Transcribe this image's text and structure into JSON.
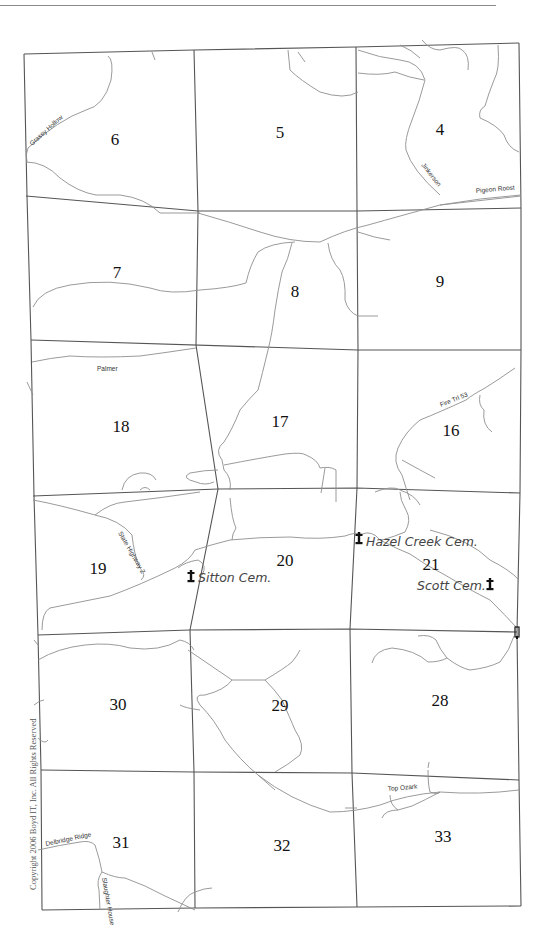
{
  "map": {
    "copyright": "Copyright 2006 Boyd IT, Inc. All Rights Reserved",
    "sections": [
      {
        "id": "6",
        "label": "6",
        "x": 115,
        "y": 145
      },
      {
        "id": "5",
        "label": "5",
        "x": 280,
        "y": 138
      },
      {
        "id": "4",
        "label": "4",
        "x": 440,
        "y": 135
      },
      {
        "id": "7",
        "label": "7",
        "x": 117,
        "y": 278
      },
      {
        "id": "8",
        "label": "8",
        "x": 295,
        "y": 297
      },
      {
        "id": "9",
        "label": "9",
        "x": 440,
        "y": 287
      },
      {
        "id": "18",
        "label": "18",
        "x": 121,
        "y": 432
      },
      {
        "id": "17",
        "label": "17",
        "x": 280,
        "y": 427
      },
      {
        "id": "16",
        "label": "16",
        "x": 451,
        "y": 436
      },
      {
        "id": "19",
        "label": "19",
        "x": 98,
        "y": 574
      },
      {
        "id": "20",
        "label": "20",
        "x": 285,
        "y": 566
      },
      {
        "id": "21",
        "label": "21",
        "x": 431,
        "y": 570
      },
      {
        "id": "30",
        "label": "30",
        "x": 118,
        "y": 710
      },
      {
        "id": "29",
        "label": "29",
        "x": 280,
        "y": 711
      },
      {
        "id": "28",
        "label": "28",
        "x": 440,
        "y": 706
      },
      {
        "id": "31",
        "label": "31",
        "x": 121,
        "y": 848
      },
      {
        "id": "32",
        "label": "32",
        "x": 282,
        "y": 851
      },
      {
        "id": "33",
        "label": "33",
        "x": 443,
        "y": 842
      }
    ],
    "road_labels": [
      {
        "name": "grassy-hollow",
        "text": "Grassy Hollow",
        "x": 32,
        "y": 146,
        "rotate": -42
      },
      {
        "name": "jinkerson",
        "text": "Jinkerson",
        "x": 422,
        "y": 167,
        "rotate": 52
      },
      {
        "name": "pigeon-roost",
        "text": "Pigeon Roost",
        "x": 476,
        "y": 192,
        "rotate": -5
      },
      {
        "name": "palmer",
        "text": "Palmer",
        "x": 97,
        "y": 371,
        "rotate": 0
      },
      {
        "name": "fire-trl-53",
        "text": "Fire Trl 53",
        "x": 441,
        "y": 408,
        "rotate": -22
      },
      {
        "name": "state-highway-z",
        "text": "State Highway Z",
        "x": 118,
        "y": 534,
        "rotate": 60
      },
      {
        "name": "top-ozark",
        "text": "Top Ozark",
        "x": 388,
        "y": 791,
        "rotate": -5
      },
      {
        "name": "delbridge-ridge",
        "text": "Delbridge Ridge",
        "x": 46,
        "y": 846,
        "rotate": -12
      },
      {
        "name": "slaughter-house",
        "text": "Slaughter House",
        "x": 96,
        "y": 875,
        "rotate": 80
      }
    ],
    "cemeteries": [
      {
        "name": "sitton-cem",
        "label": "Sitton Cem.",
        "icon_x": 191,
        "icon_y": 577,
        "label_x": 198,
        "label_y": 582
      },
      {
        "name": "hazel-creek-cem",
        "label": "Hazel Creek Cem.",
        "icon_x": 359,
        "icon_y": 538,
        "label_x": 366,
        "label_y": 546
      },
      {
        "name": "scott-cem",
        "label": "Scott Cem.",
        "icon_x": 490,
        "icon_y": 583,
        "label_x": 417,
        "label_y": 590
      }
    ]
  },
  "colors": {
    "grid": "#555555",
    "road": "#8f8f8f",
    "text": "#111111",
    "cemetery_label": "#444444",
    "background": "#ffffff"
  }
}
